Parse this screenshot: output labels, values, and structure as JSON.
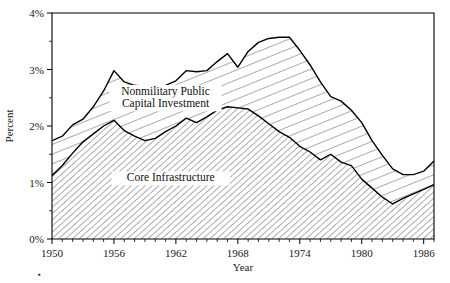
{
  "chart_data": {
    "type": "area",
    "title": "",
    "subtitle": "",
    "xlabel": "Year",
    "ylabel": "Percent",
    "xlim": [
      1950,
      1987
    ],
    "ylim": [
      0,
      4
    ],
    "grid": false,
    "legend_position": "inline-annotations",
    "y_tick_labels": [
      "0%",
      "1%",
      "2%",
      "3%",
      "4%"
    ],
    "y_tick_values": [
      0,
      1,
      2,
      3,
      4
    ],
    "y_minor_tick_values": [
      0.5,
      1.5,
      2.5,
      3.5
    ],
    "x_tick_labels": [
      "1950",
      "1956",
      "1962",
      "1968",
      "1974",
      "1980",
      "1986"
    ],
    "x_tick_values": [
      1950,
      1956,
      1962,
      1968,
      1974,
      1980,
      1986
    ],
    "x_minor_tick_step": 1,
    "x": [
      1950,
      1951,
      1952,
      1953,
      1954,
      1955,
      1956,
      1957,
      1958,
      1959,
      1960,
      1961,
      1962,
      1963,
      1964,
      1965,
      1966,
      1967,
      1968,
      1969,
      1970,
      1971,
      1972,
      1973,
      1974,
      1975,
      1976,
      1977,
      1978,
      1979,
      1980,
      1981,
      1982,
      1983,
      1984,
      1985,
      1986,
      1987
    ],
    "series": [
      {
        "name": "Nonmilitary Public Capital Investment",
        "fill": "hatch-shallow",
        "values": [
          1.74,
          1.82,
          2.02,
          2.12,
          2.34,
          2.62,
          2.98,
          2.78,
          2.72,
          2.7,
          2.68,
          2.72,
          2.8,
          2.98,
          2.96,
          2.98,
          3.14,
          3.28,
          3.04,
          3.32,
          3.48,
          3.55,
          3.57,
          3.57,
          3.34,
          3.08,
          2.78,
          2.52,
          2.44,
          2.28,
          2.06,
          1.74,
          1.48,
          1.24,
          1.14,
          1.14,
          1.2,
          1.38
        ]
      },
      {
        "name": "Core Infrastructure",
        "fill": "hatch-dense",
        "values": [
          1.12,
          1.3,
          1.52,
          1.72,
          1.86,
          2.0,
          2.1,
          1.92,
          1.82,
          1.74,
          1.78,
          1.9,
          2.0,
          2.14,
          2.06,
          2.16,
          2.28,
          2.34,
          2.32,
          2.3,
          2.18,
          2.04,
          1.9,
          1.8,
          1.64,
          1.54,
          1.4,
          1.5,
          1.36,
          1.3,
          1.06,
          0.9,
          0.74,
          0.62,
          0.72,
          0.8,
          0.88,
          0.96
        ]
      }
    ],
    "annotations": [
      {
        "text": "Nonmilitary Public",
        "x": 1961.0,
        "y": 2.55
      },
      {
        "text": "Capital Investment",
        "x": 1961.0,
        "y": 2.33
      },
      {
        "text": "Core Infrastructure",
        "x": 1961.5,
        "y": 1.02
      }
    ]
  },
  "axes": {
    "ylabel": "Percent",
    "xlabel": "Year"
  },
  "footnote_mark": "▪"
}
